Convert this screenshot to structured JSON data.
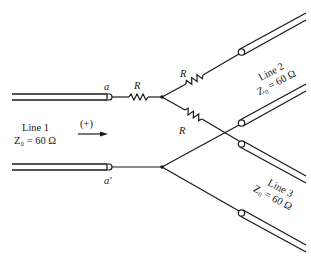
{
  "diagram": {
    "terminals": {
      "a": "a",
      "a_prime": "a′"
    },
    "resistors": [
      {
        "label": "R",
        "position": "series-input"
      },
      {
        "label": "R",
        "position": "branch-line-2"
      },
      {
        "label": "R",
        "position": "branch-line-3"
      }
    ],
    "lines": [
      {
        "name": "Line 1",
        "impedance": "Z₀ = 60 Ω"
      },
      {
        "name": "Line 2",
        "impedance": "Z₀ = 60 Ω"
      },
      {
        "name": "Line 3",
        "impedance": "Z₀ = 60 Ω"
      }
    ],
    "direction_label": "(+)",
    "colors": {
      "ink": "#1a1a1a",
      "background": "#ffffff"
    }
  }
}
